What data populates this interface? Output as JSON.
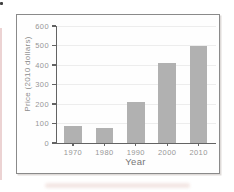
{
  "chart_data": {
    "type": "bar",
    "categories": [
      "1970",
      "1980",
      "1990",
      "2000",
      "2010"
    ],
    "values": [
      85,
      75,
      210,
      410,
      500
    ],
    "title": "",
    "xlabel": "Year",
    "ylabel": "Price (2010 dollars)",
    "ylim": [
      0,
      600
    ],
    "yticks": [
      0,
      100,
      200,
      300,
      400,
      500,
      600
    ],
    "grid": true,
    "legend": "none",
    "bar_color": "#b1b1b1",
    "axis_color": "#636363",
    "tick_label_color": "#979797",
    "frame_border_color": "#8a8a8a"
  }
}
